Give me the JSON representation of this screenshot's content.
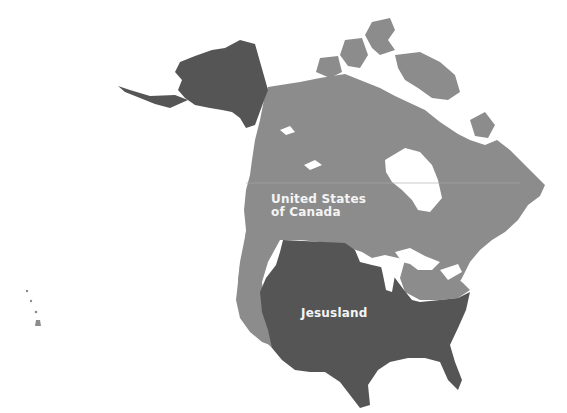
{
  "map": {
    "title": "",
    "regions": [
      {
        "id": "united-states-of-canada",
        "label_line1": "United States",
        "label_line2": "of Canada",
        "color": "#8c8c8c"
      },
      {
        "id": "jesusland",
        "label": "Jesusland",
        "color": "#555555"
      }
    ],
    "colors": {
      "background": "#ffffff",
      "dark_region": "#555555",
      "light_region": "#8c8c8c",
      "label_text": "#f4f4f4"
    }
  }
}
